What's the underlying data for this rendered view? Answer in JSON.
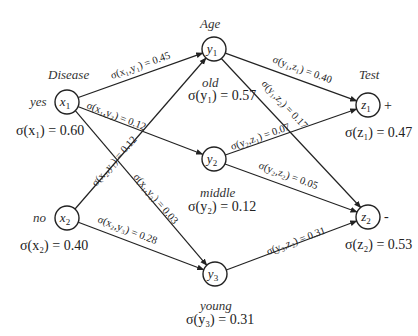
{
  "diagram": {
    "type": "bayesian-network",
    "layers": [
      {
        "title": "Disease",
        "nodes": [
          "x1",
          "x2"
        ]
      },
      {
        "title": "Age",
        "nodes": [
          "y1",
          "y2",
          "y3"
        ]
      },
      {
        "title": "Test",
        "nodes": [
          "z1",
          "z2"
        ]
      }
    ],
    "nodes": {
      "x1": {
        "name": "x",
        "sub": "1",
        "state": "yes",
        "prob_label": "σ(x₁) = 0.60",
        "prob": 0.6
      },
      "x2": {
        "name": "x",
        "sub": "2",
        "state": "no",
        "prob_label": "σ(x₂) = 0.40",
        "prob": 0.4
      },
      "y1": {
        "name": "y",
        "sub": "1",
        "state": "old",
        "prob_label": "σ(y₁) = 0.57",
        "prob": 0.57
      },
      "y2": {
        "name": "y",
        "sub": "2",
        "state": "middle",
        "prob_label": "σ(y₂) = 0.12",
        "prob": 0.12
      },
      "y3": {
        "name": "y",
        "sub": "3",
        "state": "young",
        "prob_label": "σ(y₃) = 0.31",
        "prob": 0.31
      },
      "z1": {
        "name": "z",
        "sub": "1",
        "state": "+",
        "prob_label": "σ(z₁) = 0.47",
        "prob": 0.47
      },
      "z2": {
        "name": "z",
        "sub": "2",
        "state": "-",
        "prob_label": "σ(z₂) = 0.53",
        "prob": 0.53
      }
    },
    "edges": [
      {
        "from": "x1",
        "to": "y1",
        "label": "σ(x₁,y₁) = 0.45",
        "value": 0.45
      },
      {
        "from": "x1",
        "to": "y2",
        "label": "σ(x₁,y₂) = 0.12",
        "value": 0.12
      },
      {
        "from": "x1",
        "to": "y3",
        "label": "σ(x₁,y₃) = 0.03",
        "value": 0.03
      },
      {
        "from": "x2",
        "to": "y1",
        "label": "σ(x₂,y₁) = 0.12",
        "value": 0.12
      },
      {
        "from": "x2",
        "to": "y3",
        "label": "σ(x₂,y₃) = 0.28",
        "value": 0.28
      },
      {
        "from": "y1",
        "to": "z1",
        "label": "σ(y₁,z₁) = 0.40",
        "value": 0.4
      },
      {
        "from": "y1",
        "to": "z2",
        "label": "σ(y₁,z₂) = 0.17",
        "value": 0.17
      },
      {
        "from": "y2",
        "to": "z1",
        "label": "σ(y₂,z₁) = 0.07",
        "value": 0.07
      },
      {
        "from": "y2",
        "to": "z2",
        "label": "σ(y₂,z₂) = 0.05",
        "value": 0.05
      },
      {
        "from": "y3",
        "to": "z2",
        "label": "σ(y₃,z₂) = 0.31",
        "value": 0.31
      }
    ]
  }
}
